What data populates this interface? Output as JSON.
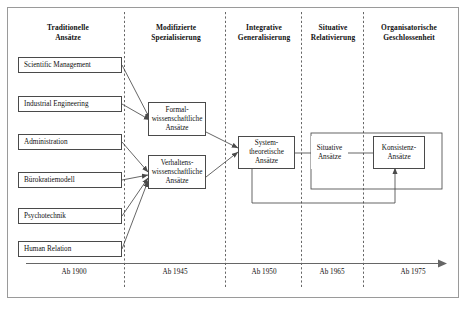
{
  "diagram": {
    "title_columns": [
      {
        "line1": "Traditionelle",
        "line2": "Ansätze"
      },
      {
        "line1": "Modifizierte",
        "line2": "Spezialisierung"
      },
      {
        "line1": "Integrative",
        "line2": "Generalisierung"
      },
      {
        "line1": "Situative",
        "line2": "Relativierung"
      },
      {
        "line1": "Organisatorische",
        "line2": "Geschlossenheit"
      }
    ],
    "left_nodes": [
      {
        "label": "Scientific Management"
      },
      {
        "label": "Industrial Engineering"
      },
      {
        "label": "Administration"
      },
      {
        "label": "Bürokratiemodell"
      },
      {
        "label": "Psychotechnik"
      },
      {
        "label": "Human Relation"
      }
    ],
    "middle_nodes": [
      {
        "line1": "Formal-",
        "line2": "wissenschaftliche",
        "line3": "Ansätze"
      },
      {
        "line1": "Verhaltens-",
        "line2": "wissenschaftliche",
        "line3": "Ansätze"
      }
    ],
    "stage_nodes": [
      {
        "line1": "System-",
        "line2": "theoretische",
        "line3": "Ansätze"
      },
      {
        "line1": "Situative",
        "line2": "Ansätze",
        "line3": ""
      },
      {
        "line1": "Konsistenz-",
        "line2": "Ansätze",
        "line3": ""
      }
    ],
    "timeline_labels": [
      "Ab 1900",
      "Ab 1945",
      "Ab 1950",
      "Ab 1965",
      "Ab 1975"
    ],
    "colors": {
      "frame_border": "#9a9a9a",
      "box_border": "#4a4a4a",
      "connector": "#4a4a4a",
      "divider": "#555555",
      "axis": "#666666",
      "text": "#111111",
      "background": "#ffffff"
    }
  }
}
